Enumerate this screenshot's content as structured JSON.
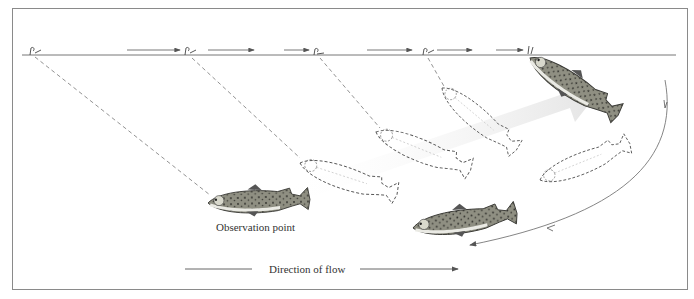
{
  "diagram": {
    "labels": {
      "observation_point": "Observation point",
      "direction_of_flow": "Direction of flow"
    },
    "colors": {
      "frame": "#8a8a8a",
      "line": "#6e6e6e",
      "fish_body": "#9a9a8c",
      "fish_dark": "#4a4a44",
      "ghost_arrow": "#e4e4e4"
    },
    "elements": {
      "water_surface": "horizontal surface line",
      "fly_positions": 5,
      "ghost_fish_outlines": 3,
      "solid_fish": 3,
      "return_arc": "curved arrow showing fish returning to position"
    }
  }
}
